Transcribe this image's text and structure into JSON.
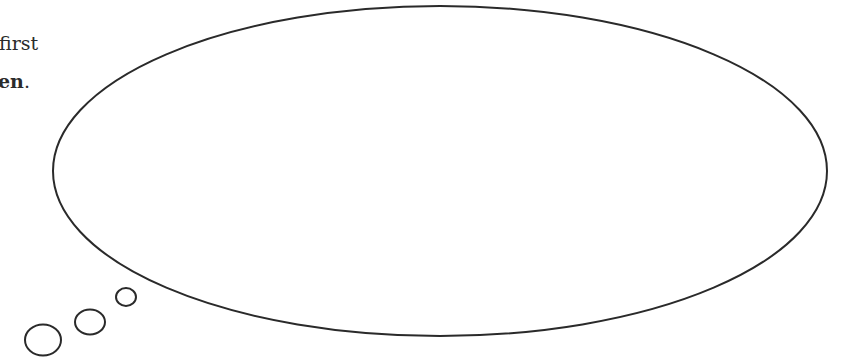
{
  "text": {
    "line1": "first",
    "line2_bold": "en",
    "line2_suffix": "."
  },
  "bubble": {
    "type": "thought-bubble",
    "stroke_color": "#2a2a2a",
    "fill_color": "#ffffff",
    "content": ""
  }
}
